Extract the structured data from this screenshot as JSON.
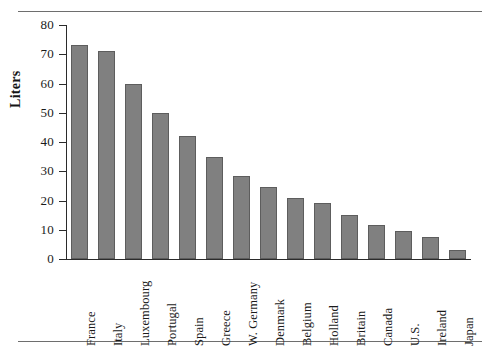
{
  "figure": {
    "has_top_rule": true,
    "has_bottom_rule": true,
    "rule_color": "#6e6e6e",
    "background": "#ffffff"
  },
  "chart_data": {
    "type": "bar",
    "title": "",
    "xlabel": "",
    "ylabel": "Liters",
    "ylim": [
      0,
      80
    ],
    "yticks": [
      0,
      10,
      20,
      30,
      40,
      50,
      60,
      70,
      80
    ],
    "ytick_labels": [
      "0",
      "10",
      "20",
      "30",
      "40",
      "50",
      "60",
      "70",
      "80"
    ],
    "grid": false,
    "legend": null,
    "orientation": "vertical",
    "bar_color": "#808080",
    "bar_edge_color": "#5d5d5d",
    "axis_color": "#2b2b2b",
    "categories": [
      "France",
      "Italy",
      "Luxembourg",
      "Portugal",
      "Spain",
      "Greece",
      "W. Germany",
      "Denmark",
      "Belgium",
      "Holland",
      "Britain",
      "Canada",
      "U.S.",
      "Ireland",
      "Japan"
    ],
    "values": [
      73,
      71,
      60,
      50,
      42,
      35,
      28.5,
      24.5,
      21,
      19,
      15,
      11.5,
      9.5,
      7.5,
      3
    ]
  }
}
